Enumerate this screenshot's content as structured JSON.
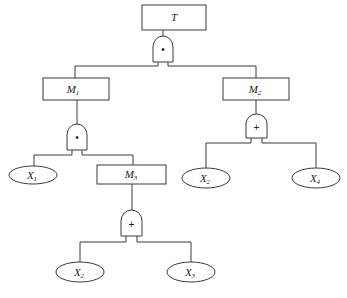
{
  "diagram": {
    "type": "fault-tree",
    "colors": {
      "stroke": "#3a3a3a",
      "text": "#222222",
      "background": "#ffffff"
    },
    "nodes": {
      "T": {
        "label": "T",
        "sub": ""
      },
      "M1": {
        "label": "M",
        "sub": "1"
      },
      "M2": {
        "label": "M",
        "sub": "2"
      },
      "M3": {
        "label": "M",
        "sub": "3"
      },
      "X1": {
        "label": "X",
        "sub": "1"
      },
      "X2a": {
        "label": "X",
        "sub": "2"
      },
      "X4": {
        "label": "X",
        "sub": "4"
      },
      "X2b": {
        "label": "X",
        "sub": "2"
      },
      "X3": {
        "label": "X",
        "sub": "3"
      }
    },
    "gates": {
      "g_T": {
        "type": "AND",
        "symbol": "•"
      },
      "g_M1": {
        "type": "AND",
        "symbol": "•"
      },
      "g_M2": {
        "type": "OR",
        "symbol": "+"
      },
      "g_M3": {
        "type": "OR",
        "symbol": "+"
      }
    },
    "edges": [
      [
        "T",
        "g_T"
      ],
      [
        "g_T",
        "M1"
      ],
      [
        "g_T",
        "M2"
      ],
      [
        "M1",
        "g_M1"
      ],
      [
        "g_M1",
        "X1"
      ],
      [
        "g_M1",
        "M3"
      ],
      [
        "M2",
        "g_M2"
      ],
      [
        "g_M2",
        "X2a"
      ],
      [
        "g_M2",
        "X4"
      ],
      [
        "M3",
        "g_M3"
      ],
      [
        "g_M3",
        "X2b"
      ],
      [
        "g_M3",
        "X3"
      ]
    ]
  }
}
